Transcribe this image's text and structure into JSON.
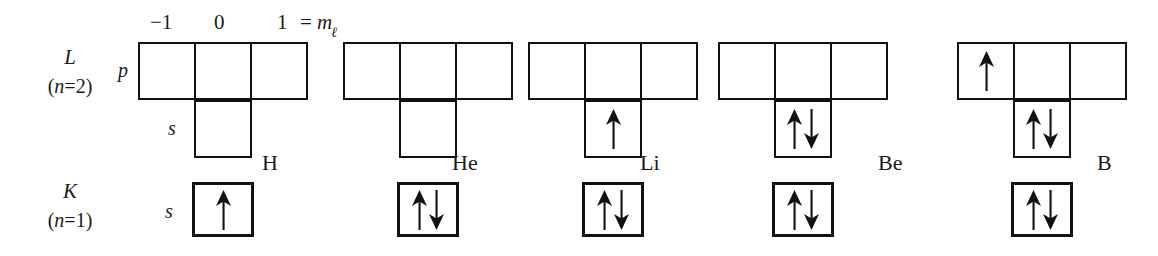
{
  "figure": {
    "header": {
      "m_values": [
        "−1",
        "0",
        "1"
      ],
      "equals": "=",
      "m_symbol": "m",
      "m_subscript": "ℓ"
    },
    "shells": [
      {
        "id": "L",
        "letter": "L",
        "n_label_open": "(",
        "n_label": "n",
        "n_label_eq": "=2",
        "n_label_close": ")",
        "subshells": [
          {
            "id": "p",
            "label": "p",
            "cells": 3
          },
          {
            "id": "s2",
            "label": "s",
            "cells": 1
          }
        ]
      },
      {
        "id": "K",
        "letter": "K",
        "n_label_open": "(",
        "n_label": "n",
        "n_label_eq": "=1",
        "n_label_close": ")",
        "subshells": [
          {
            "id": "s1",
            "label": "s",
            "cells": 1
          }
        ]
      }
    ],
    "elements": [
      {
        "symbol": "H",
        "p": [
          "",
          "",
          ""
        ],
        "s2": "",
        "s1": "up"
      },
      {
        "symbol": "He",
        "p": [
          "",
          "",
          ""
        ],
        "s2": "",
        "s1": "updown"
      },
      {
        "symbol": "Li",
        "p": [
          "",
          "",
          ""
        ],
        "s2": "up",
        "s1": "updown"
      },
      {
        "symbol": "Be",
        "p": [
          "",
          "",
          ""
        ],
        "s2": "updown",
        "s1": "updown"
      },
      {
        "symbol": "B",
        "p": [
          "up",
          "",
          ""
        ],
        "s2": "updown",
        "s1": "updown"
      }
    ],
    "colors": {
      "ink": "#111111",
      "background": "#ffffff"
    }
  }
}
